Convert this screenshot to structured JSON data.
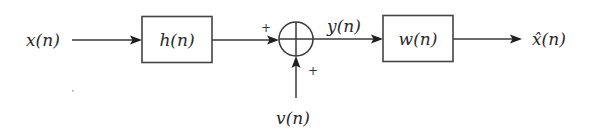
{
  "diagram": {
    "type": "signal-flow block diagram",
    "input_label": "x(n)",
    "blocks": [
      {
        "id": "h",
        "label": "h(n)"
      },
      {
        "id": "w",
        "label": "w(n)"
      }
    ],
    "summing_junction": {
      "symbol": "⊕",
      "input_signs": [
        "+",
        "+"
      ]
    },
    "noise_label": "v(n)",
    "intermediate_label": "y(n)",
    "output_label": "x̂(n)",
    "signs": {
      "left": "+",
      "bottom": "+"
    }
  }
}
